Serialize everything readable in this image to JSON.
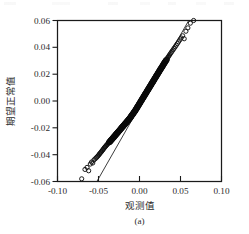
{
  "figure": {
    "caption": "(a)",
    "background_color": "#ffffff",
    "ink_color": "#1a1a1a"
  },
  "chart_data": {
    "type": "scatter",
    "title": "",
    "subtitle": "",
    "xlabel": "观测值",
    "ylabel": "期望正常值",
    "xlim": [
      -0.1,
      0.1
    ],
    "ylim": [
      -0.06,
      0.06
    ],
    "xticks": [
      -0.1,
      -0.05,
      0.0,
      0.05,
      0.1
    ],
    "yticks": [
      -0.06,
      -0.04,
      -0.02,
      0.0,
      0.02,
      0.04,
      0.06
    ],
    "xticklabels": [
      "-0.10",
      "-0.05",
      "0.00",
      "0.05",
      "0.10"
    ],
    "yticklabels": [
      "-0.06",
      "-0.04",
      "-0.02",
      "0.00",
      "0.02",
      "0.04",
      "0.06"
    ],
    "grid": false,
    "legend": false,
    "legend_position": "none",
    "marker_style": "open-circle",
    "marker_color": "#111111",
    "annotations": [],
    "reference_line": {
      "label": "normal reference line",
      "x": [
        -0.052,
        0.06
      ],
      "y": [
        -0.06,
        0.06
      ],
      "style": "solid",
      "color": "#1a1a1a"
    },
    "series": [
      {
        "name": "Q-Q points",
        "x": [
          -0.0705,
          -0.0665,
          -0.064,
          -0.062,
          -0.06,
          -0.0585,
          -0.057,
          -0.0556,
          -0.0543,
          -0.053,
          -0.052,
          -0.051,
          -0.05,
          -0.0492,
          -0.0484,
          -0.0476,
          -0.0468,
          -0.046,
          -0.0452,
          -0.0445,
          -0.0438,
          -0.0431,
          -0.0424,
          -0.0417,
          -0.041,
          -0.0403,
          -0.0396,
          -0.0389,
          -0.0382,
          -0.0375,
          -0.0368,
          -0.0361,
          -0.0354,
          -0.0347,
          -0.034,
          -0.0333,
          -0.0326,
          -0.0319,
          -0.0312,
          -0.0305,
          -0.0298,
          -0.0291,
          -0.0284,
          -0.0277,
          -0.027,
          -0.0263,
          -0.0256,
          -0.0249,
          -0.0242,
          -0.0235,
          -0.0228,
          -0.0221,
          -0.0214,
          -0.0207,
          -0.02,
          -0.0193,
          -0.0186,
          -0.0179,
          -0.0172,
          -0.0165,
          -0.0158,
          -0.0151,
          -0.0144,
          -0.0137,
          -0.013,
          -0.0123,
          -0.0116,
          -0.0109,
          -0.0102,
          -0.0095,
          -0.0088,
          -0.0081,
          -0.0074,
          -0.0067,
          -0.006,
          -0.0053,
          -0.0046,
          -0.0039,
          -0.0032,
          -0.0025,
          -0.0018,
          -0.0011,
          -0.0004,
          0.0003,
          0.001,
          0.0017,
          0.0024,
          0.0031,
          0.0038,
          0.0045,
          0.0052,
          0.0059,
          0.0066,
          0.0073,
          0.008,
          0.0087,
          0.0094,
          0.0101,
          0.0108,
          0.0115,
          0.0122,
          0.0129,
          0.0136,
          0.0143,
          0.015,
          0.0157,
          0.0164,
          0.0171,
          0.0178,
          0.0185,
          0.0192,
          0.0199,
          0.0206,
          0.0213,
          0.022,
          0.0227,
          0.0234,
          0.0241,
          0.0248,
          0.0255,
          0.0262,
          0.027,
          0.0278,
          0.0286,
          0.0294,
          0.0302,
          0.031,
          0.0319,
          0.0328,
          0.0337,
          0.0346,
          0.0356,
          0.0366,
          0.0376,
          0.0387,
          0.0398,
          0.041,
          0.0422,
          0.0435,
          0.0448,
          0.0462,
          0.0476,
          0.0492,
          0.0508,
          0.0526,
          0.0545,
          0.0566,
          0.059,
          0.062,
          0.066
        ],
        "y": [
          -0.058,
          -0.051,
          -0.0495,
          -0.052,
          -0.047,
          -0.0455,
          -0.0462,
          -0.044,
          -0.0432,
          -0.0425,
          -0.0418,
          -0.0412,
          -0.0405,
          -0.0398,
          -0.0392,
          -0.0386,
          -0.038,
          -0.0374,
          -0.0368,
          -0.0362,
          -0.0356,
          -0.035,
          -0.0345,
          -0.034,
          -0.0335,
          -0.033,
          -0.0325,
          -0.032,
          -0.0315,
          -0.031,
          -0.0305,
          -0.03,
          -0.0295,
          -0.029,
          -0.0285,
          -0.028,
          -0.0275,
          -0.027,
          -0.0265,
          -0.026,
          -0.0255,
          -0.025,
          -0.0245,
          -0.024,
          -0.0235,
          -0.023,
          -0.0225,
          -0.022,
          -0.0215,
          -0.021,
          -0.0205,
          -0.02,
          -0.0195,
          -0.019,
          -0.0185,
          -0.018,
          -0.0175,
          -0.017,
          -0.0165,
          -0.016,
          -0.0155,
          -0.015,
          -0.0145,
          -0.014,
          -0.0135,
          -0.013,
          -0.0124,
          -0.0118,
          -0.0112,
          -0.0106,
          -0.01,
          -0.0094,
          -0.0088,
          -0.0082,
          -0.0076,
          -0.007,
          -0.0063,
          -0.0056,
          -0.0049,
          -0.0042,
          -0.0035,
          -0.0028,
          -0.0021,
          -0.0014,
          -0.0007,
          0.0,
          0.0007,
          0.0014,
          0.0021,
          0.0028,
          0.0035,
          0.0042,
          0.0049,
          0.0056,
          0.0063,
          0.007,
          0.0077,
          0.0084,
          0.0091,
          0.0098,
          0.0105,
          0.0112,
          0.0119,
          0.0126,
          0.0133,
          0.014,
          0.0147,
          0.0154,
          0.0161,
          0.0168,
          0.0175,
          0.0182,
          0.0189,
          0.0196,
          0.0203,
          0.021,
          0.0217,
          0.0224,
          0.0231,
          0.0238,
          0.0245,
          0.0252,
          0.026,
          0.0268,
          0.0276,
          0.0284,
          0.0292,
          0.03,
          0.0308,
          0.0316,
          0.0325,
          0.0334,
          0.0343,
          0.0352,
          0.0362,
          0.0372,
          0.0382,
          0.0393,
          0.0404,
          0.0416,
          0.0428,
          0.0441,
          0.0455,
          0.047,
          0.0486,
          0.0464,
          0.052,
          0.0545,
          0.058,
          0.06
        ]
      }
    ]
  }
}
